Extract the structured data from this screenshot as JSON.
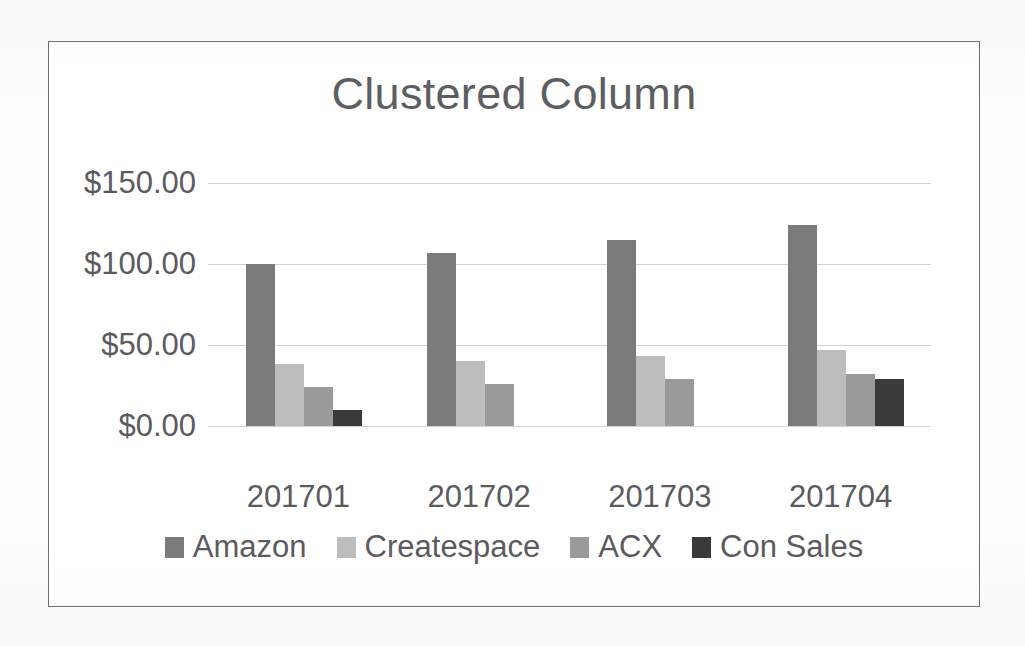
{
  "chart_data": {
    "type": "bar",
    "title": "Clustered Column",
    "xlabel": "",
    "ylabel": "",
    "categories": [
      "201701",
      "201702",
      "201703",
      "201704"
    ],
    "series": [
      {
        "name": "Amazon",
        "values": [
          100,
          107,
          115,
          124
        ],
        "color": "#7b7b7b"
      },
      {
        "name": "Createspace",
        "values": [
          38,
          40,
          43,
          47
        ],
        "color": "#bdbdbd"
      },
      {
        "name": "ACX",
        "values": [
          24,
          26,
          29,
          32
        ],
        "color": "#9a9a9a"
      },
      {
        "name": "Con Sales",
        "values": [
          10,
          0,
          0,
          29
        ],
        "color": "#3a3a3a"
      }
    ],
    "ylim": [
      0,
      150
    ],
    "yticks": [
      0,
      50,
      100,
      150
    ],
    "ytick_labels": [
      "$0.00",
      "$50.00",
      "$100.00",
      "$150.00"
    ],
    "grid": true,
    "legend_position": "bottom"
  },
  "style": {
    "text_color": "#5b5b5f",
    "gridline_color": "#d2d2d4",
    "frame_color": "#6f6f75",
    "background": "#ffffff"
  }
}
